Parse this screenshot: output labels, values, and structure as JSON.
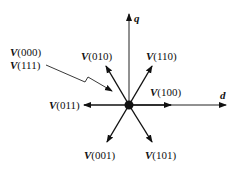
{
  "diagram": {
    "axes": {
      "d": "d",
      "q": "q"
    },
    "vectors": [
      {
        "id": "v100",
        "prefix": "V",
        "code": "(100)"
      },
      {
        "id": "v110",
        "prefix": "V",
        "code": "(110)"
      },
      {
        "id": "v010",
        "prefix": "V",
        "code": "(010)"
      },
      {
        "id": "v011",
        "prefix": "V",
        "code": "(011)"
      },
      {
        "id": "v001",
        "prefix": "V",
        "code": "(001)"
      },
      {
        "id": "v101",
        "prefix": "V",
        "code": "(101)"
      }
    ],
    "zero_vectors": [
      {
        "prefix": "V",
        "code": "(000)"
      },
      {
        "prefix": "V",
        "code": "(111)"
      }
    ]
  }
}
